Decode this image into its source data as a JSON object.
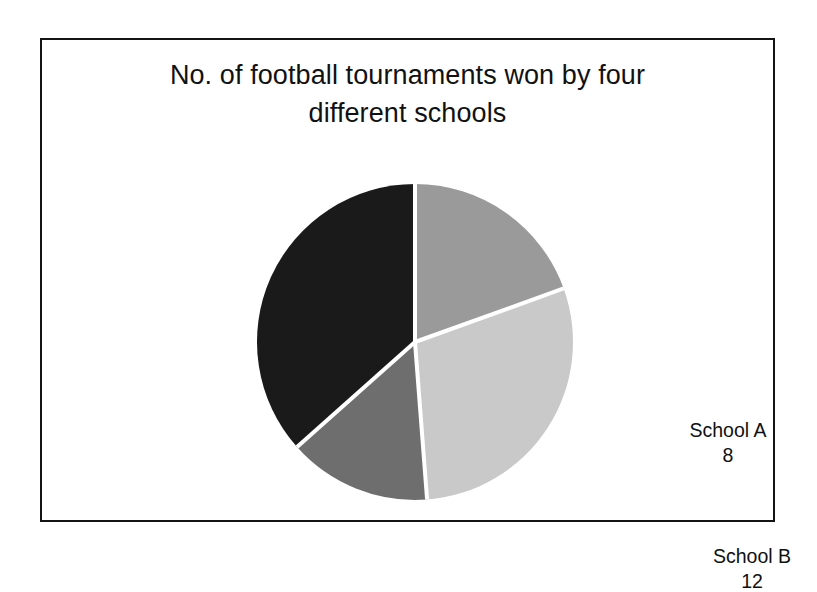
{
  "figure": {
    "title_line1": "No. of football tournaments won by four",
    "title_line2": "different  schools",
    "title_full": "No. of football tournaments won by four different  schools",
    "background_color": "#ffffff",
    "border_color": "#131313"
  },
  "chart_data": {
    "type": "pie",
    "title": "No. of football tournaments won by four different  schools",
    "xlabel": "",
    "ylabel": "",
    "categories": [
      "School A",
      "School B",
      "School C",
      "School D"
    ],
    "values": [
      8,
      12,
      6,
      15
    ],
    "total": 41,
    "start_angle_deg": 0,
    "direction": "clockwise",
    "grid": false,
    "legend": "none",
    "labels_position": "inside-slices",
    "slices": [
      {
        "name": "School A",
        "value": 8,
        "value_text": "8",
        "color": "#9a9a9a",
        "label_color": "#111111",
        "start_deg": 0,
        "end_deg": 70.2
      },
      {
        "name": "School B",
        "value": 12,
        "value_text": "12",
        "color": "#c9c9c9",
        "label_color": "#111111",
        "start_deg": 70.2,
        "end_deg": 175.6
      },
      {
        "name": "School C",
        "value": 6,
        "value_text": "6",
        "color": "#6e6e6e",
        "label_color": "#ffffff",
        "start_deg": 175.6,
        "end_deg": 228.3
      },
      {
        "name": "School D",
        "value": 15,
        "value_text": "15",
        "color": "#1a1a1a",
        "label_color": "#ffffff",
        "start_deg": 228.3,
        "end_deg": 360
      }
    ],
    "separator_color": "#ffffff"
  }
}
